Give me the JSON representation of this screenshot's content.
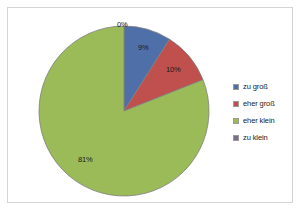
{
  "chart_data": {
    "type": "pie",
    "title": "",
    "subtitle": "",
    "xlabel": "",
    "ylabel": "",
    "grid": false,
    "legend_position": "right",
    "start_angle_deg": 0,
    "direction": "clockwise",
    "categories": [
      "zu groß",
      "eher groß",
      "eher klein",
      "zu klein"
    ],
    "values": [
      9,
      10,
      81,
      0
    ],
    "value_unit": "%",
    "data_labels": [
      "9%",
      "10%",
      "81%",
      "0%"
    ],
    "colors": [
      "#4f6fa8",
      "#c0504d",
      "#9bbb59",
      "#7b6f8e"
    ],
    "slices": [
      {
        "label": "zu groß",
        "value": 9,
        "data_label": "9%",
        "color": "#4f6fa8"
      },
      {
        "label": "eher groß",
        "value": 10,
        "data_label": "10%",
        "color": "#c0504d"
      },
      {
        "label": "eher klein",
        "value": 81,
        "data_label": "81%",
        "color": "#9bbb59"
      },
      {
        "label": "zu klein",
        "value": 0,
        "data_label": "0%",
        "color": "#7b6f8e"
      }
    ]
  },
  "labels": {
    "zero": "0%",
    "blue": "9%",
    "red": "10%",
    "green": "81%"
  },
  "legend": {
    "items": [
      {
        "label": "zu groß",
        "color": "#4f6fa8"
      },
      {
        "label": "eher groß",
        "color": "#c0504d"
      },
      {
        "label": "eher klein",
        "color": "#9bbb59"
      },
      {
        "label": "zu klein",
        "color": "#7b6f8e"
      }
    ]
  },
  "style": {
    "background": "#ffffff",
    "frame_border": "#d2d4d8",
    "slice_outline": "#7f7f7f",
    "text": "#1a1a1a"
  }
}
